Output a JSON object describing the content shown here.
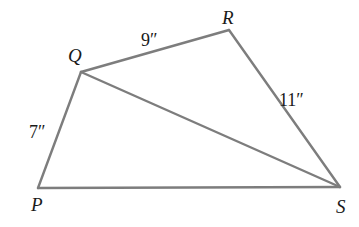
{
  "diagram": {
    "type": "quadrilateral-with-diagonal",
    "vertices": [
      {
        "id": "P",
        "label": "P",
        "x": 38,
        "y": 188,
        "label_x": 31,
        "label_y": 211
      },
      {
        "id": "Q",
        "label": "Q",
        "x": 81,
        "y": 72,
        "label_x": 68,
        "label_y": 62
      },
      {
        "id": "R",
        "label": "R",
        "x": 229,
        "y": 30,
        "label_x": 222,
        "label_y": 24
      },
      {
        "id": "S",
        "label": "S",
        "x": 340,
        "y": 187,
        "label_x": 336,
        "label_y": 213
      }
    ],
    "edges": [
      {
        "from": "P",
        "to": "Q",
        "length_label": "7″",
        "label_x": 29,
        "label_y": 138
      },
      {
        "from": "Q",
        "to": "R",
        "length_label": "9″",
        "label_x": 141,
        "label_y": 46
      },
      {
        "from": "R",
        "to": "S",
        "length_label": "11″",
        "label_x": 279,
        "label_y": 106
      },
      {
        "from": "P",
        "to": "S",
        "length_label": null
      },
      {
        "from": "Q",
        "to": "S",
        "length_label": null,
        "kind": "diagonal"
      }
    ],
    "colors": {
      "line": "#7d7d7d",
      "text": "#1a1a1a",
      "background": "#ffffff"
    }
  }
}
